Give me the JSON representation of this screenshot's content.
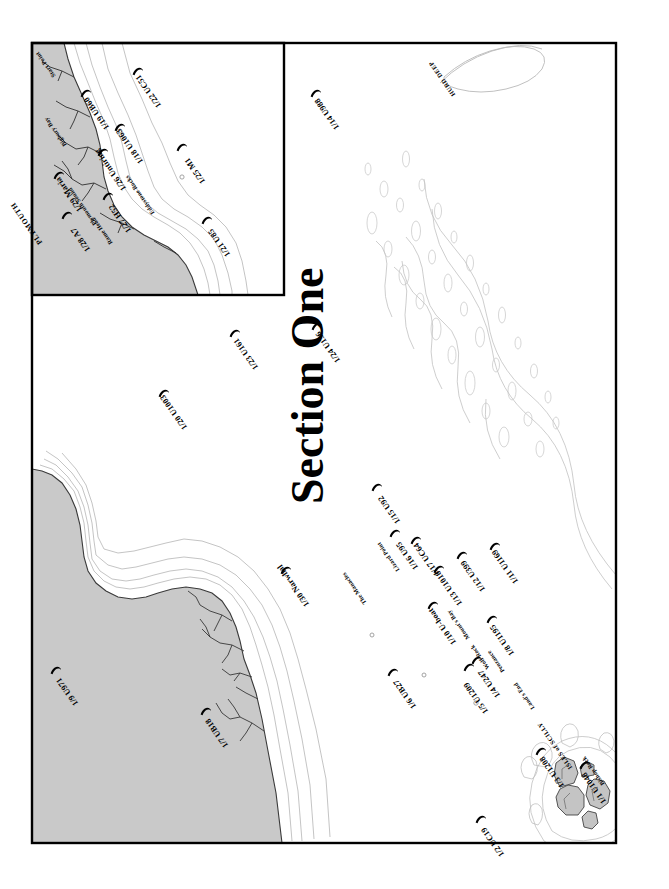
{
  "map": {
    "title": "Section One",
    "width": 669,
    "height": 889,
    "orientation": "rotated-90",
    "colors": {
      "land": "#c8c8c8",
      "land_stroke": "#2a2a2a",
      "sea": "#ffffff",
      "depth_contour": "#b9b9b9",
      "frame": "#000000",
      "marker": "#000000",
      "text": "#000000"
    },
    "frames": [
      {
        "name": "main-frame",
        "note": "large outer map boundary"
      },
      {
        "name": "inset-frame",
        "note": "Plymouth / south Devon inset box, upper left"
      }
    ]
  },
  "place_labels": [
    {
      "name": "plymouth",
      "text": "PLYMOUTH",
      "style": "city"
    },
    {
      "name": "plymouth-sound",
      "text": "Plymouth Sound",
      "style": "place-sm"
    },
    {
      "name": "rame-head",
      "text": "Rame Head",
      "style": "place-sm"
    },
    {
      "name": "bigbury-bay",
      "text": "Bigbury Bay",
      "style": "place-sm"
    },
    {
      "name": "start-point",
      "text": "Start Point",
      "style": "place-sm"
    },
    {
      "name": "eddystone-rocks",
      "text": "Eddystone Rocks",
      "style": "place-sm"
    },
    {
      "name": "the-manacles",
      "text": "The Manacles",
      "style": "place-sm"
    },
    {
      "name": "lizard-point",
      "text": "Lizard Point",
      "style": "place-sm"
    },
    {
      "name": "mounts-bay",
      "text": "Mount's Bay",
      "style": "place-sm"
    },
    {
      "name": "penzance",
      "text": "Penzance",
      "style": "place-sm"
    },
    {
      "name": "lands-end",
      "text": "Land's End",
      "style": "place-sm"
    },
    {
      "name": "wolf-rock",
      "text": "Wolf Rock",
      "style": "place-sm"
    },
    {
      "name": "isles-of-scilly",
      "text": "ISLES of SCILLY",
      "style": "isles"
    },
    {
      "name": "bishop-rock",
      "text": "Bishop Rock",
      "style": "place-sm"
    },
    {
      "name": "hurd-deep",
      "text": "HURD DEEP",
      "style": "hurd"
    }
  ],
  "wrecks": [
    {
      "id": 1,
      "text": "1/1 U1048"
    },
    {
      "id": 2,
      "text": "1/2 UC19"
    },
    {
      "id": 3,
      "text": "1/3 U1208"
    },
    {
      "id": 4,
      "text": "1/4 U247"
    },
    {
      "id": 5,
      "text": "1/5 U1209"
    },
    {
      "id": 6,
      "text": "1/6 UB27"
    },
    {
      "id": 7,
      "text": "1/7 UB18"
    },
    {
      "id": 8,
      "text": "1/8 U1195"
    },
    {
      "id": 9,
      "text": "1/9 U971"
    },
    {
      "id": 10,
      "text": "1/10 U-boat"
    },
    {
      "id": 11,
      "text": "1/11 U1169"
    },
    {
      "id": 12,
      "text": "1/12 U399"
    },
    {
      "id": 13,
      "text": "1/13 U1018"
    },
    {
      "id": 14,
      "text": "1/14 U988"
    },
    {
      "id": 15,
      "text": "1/15 U92"
    },
    {
      "id": 16,
      "text": "1/16 U95"
    },
    {
      "id": 17,
      "text": "1/17 UC64"
    },
    {
      "id": 18,
      "text": "1/18 U1063"
    },
    {
      "id": 19,
      "text": "1/19 UB60"
    },
    {
      "id": 20,
      "text": "1/20 U1003"
    },
    {
      "id": 21,
      "text": "1/21 U85"
    },
    {
      "id": 22,
      "text": "1/22 UC51"
    },
    {
      "id": 23,
      "text": "1/23 U161"
    },
    {
      "id": 24,
      "text": "1/24 U136"
    },
    {
      "id": 25,
      "text": "1/25 M1"
    },
    {
      "id": 26,
      "text": "1/26 Untiring"
    },
    {
      "id": 27,
      "text": "1/27 H52"
    },
    {
      "id": 28,
      "text": "1/28 A7"
    },
    {
      "id": 29,
      "text": "1/29 Maria"
    },
    {
      "id": 30,
      "text": "1/30 Narwhal"
    }
  ]
}
